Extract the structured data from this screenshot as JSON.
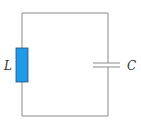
{
  "diagram": {
    "type": "LC circuit",
    "components": [
      {
        "id": "inductor",
        "symbol": "rectangle",
        "label": "L",
        "position": "left branch"
      },
      {
        "id": "capacitor",
        "symbol": "parallel-plates",
        "label": "C",
        "position": "right branch"
      }
    ],
    "labels": {
      "inductor": "L",
      "capacitor": "C"
    },
    "colors": {
      "wire": "#8a8a8a",
      "inductor_fill": "#1e9be8",
      "inductor_stroke": "#2a4f7a",
      "label": "#333333",
      "background": "#ffffff"
    }
  }
}
